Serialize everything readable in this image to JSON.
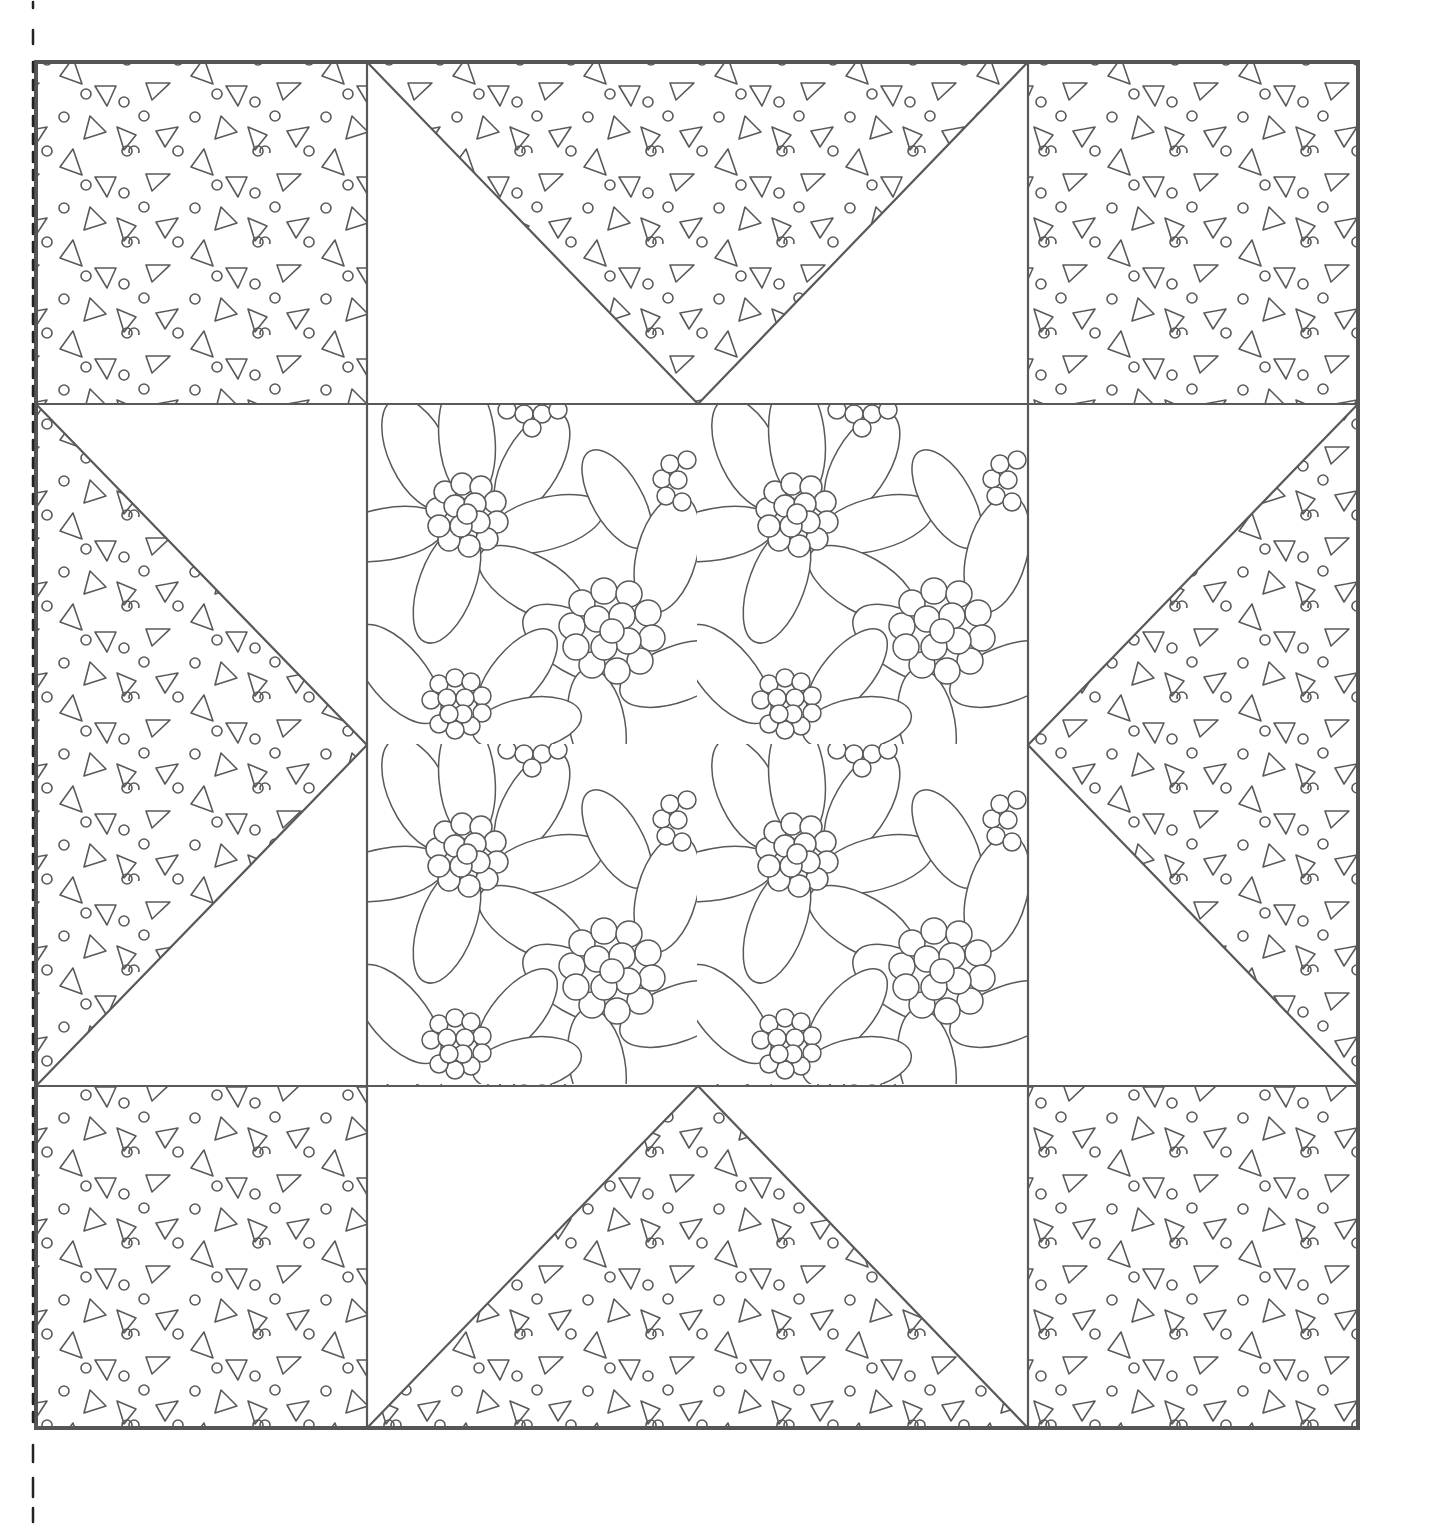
{
  "colors": {
    "line": "#595959",
    "border": "#555555",
    "background": "#ffffff",
    "trim_marks": "#222222"
  },
  "block": {
    "layout": "3x3",
    "outer_border": {
      "x1": 36,
      "y1": 62,
      "x2": 1358,
      "y2": 1428
    },
    "grid_x": [
      36,
      367,
      1028,
      1358
    ],
    "grid_y": [
      62,
      404,
      1086,
      1428
    ],
    "cells": [
      {
        "id": "corner-top-left",
        "fabric": "confetti-print"
      },
      {
        "id": "star-point-top",
        "fabric": "confetti-print",
        "background": "plain"
      },
      {
        "id": "corner-top-right",
        "fabric": "confetti-print"
      },
      {
        "id": "star-point-left",
        "fabric": "confetti-print",
        "background": "plain"
      },
      {
        "id": "center-square",
        "fabric": "floral-print"
      },
      {
        "id": "star-point-right",
        "fabric": "confetti-print",
        "background": "plain"
      },
      {
        "id": "corner-bottom-left",
        "fabric": "confetti-print"
      },
      {
        "id": "star-point-bottom",
        "fabric": "confetti-print",
        "background": "plain"
      },
      {
        "id": "corner-bottom-right",
        "fabric": "confetti-print"
      }
    ]
  },
  "trim_marks": {
    "x": 33,
    "segments_top": [
      [
        0,
        8
      ],
      [
        28,
        44
      ],
      [
        62,
        80
      ]
    ],
    "segments_bottom": [
      [
        1445,
        1462
      ],
      [
        1478,
        1497
      ],
      [
        1508,
        1522
      ]
    ]
  }
}
